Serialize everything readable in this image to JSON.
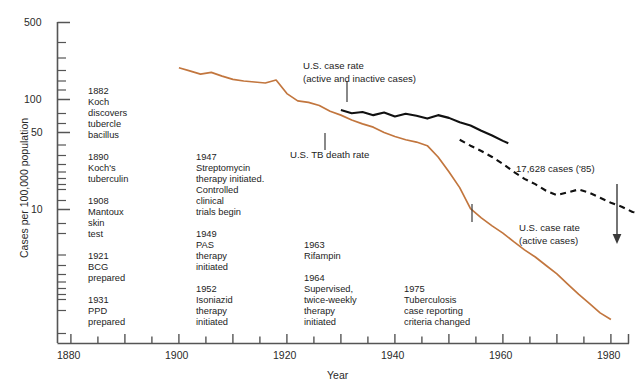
{
  "chart_data": {
    "type": "line",
    "title": "",
    "xlabel": "Year",
    "ylabel": "Cases per 100,000 population",
    "yscale": "log",
    "ylim": [
      1,
      600
    ],
    "xlim": [
      1875,
      1987
    ],
    "grid": false,
    "legend_position": "inline-annotations",
    "y_tick_labels": [
      "500",
      "100",
      "50",
      "10"
    ],
    "y_tick_values": [
      500,
      100,
      50,
      10
    ],
    "x_tick_labels": [
      "1880",
      "1900",
      "1920",
      "1940",
      "1960",
      "1980"
    ],
    "x_tick_values": [
      1880,
      1900,
      1920,
      1940,
      1960,
      1980
    ],
    "x_minor_step": 5,
    "series": [
      {
        "name": "U.S. TB death rate",
        "color": "#c2763e",
        "style": "solid",
        "x": [
          1900,
          1902,
          1904,
          1906,
          1908,
          1910,
          1912,
          1914,
          1916,
          1918,
          1920,
          1922,
          1924,
          1926,
          1928,
          1930,
          1932,
          1934,
          1936,
          1938,
          1940,
          1942,
          1944,
          1946,
          1948,
          1950,
          1952,
          1954,
          1956,
          1958,
          1960,
          1962,
          1964,
          1966,
          1968,
          1970,
          1972,
          1974,
          1976,
          1978,
          1980
        ],
        "y": [
          194,
          182,
          170,
          176,
          163,
          152,
          147,
          144,
          141,
          150,
          113,
          97,
          94,
          88,
          78,
          72,
          65,
          60,
          56,
          50,
          46,
          43,
          41,
          38,
          30,
          22,
          15.8,
          10.2,
          8.4,
          7.1,
          6.1,
          5.1,
          4.3,
          3.7,
          3.1,
          2.6,
          2.1,
          1.7,
          1.4,
          1.15,
          1.0
        ]
      },
      {
        "name": "U.S. case rate (active and inactive cases)",
        "color": "#111111",
        "style": "solid",
        "x": [
          1930,
          1932,
          1934,
          1936,
          1938,
          1940,
          1942,
          1944,
          1946,
          1948,
          1950,
          1952,
          1954,
          1956,
          1958,
          1960,
          1961
        ],
        "y": [
          80,
          75,
          77,
          72,
          76,
          70,
          74,
          71,
          67,
          72,
          68,
          62,
          58,
          52,
          47,
          42,
          40
        ]
      },
      {
        "name": "U.S. case rate (active cases)",
        "color": "#111111",
        "style": "dashed",
        "x": [
          1952,
          1954,
          1956,
          1958,
          1960,
          1962,
          1964,
          1966,
          1968,
          1970,
          1972,
          1974,
          1976,
          1978,
          1980,
          1982,
          1984,
          1985
        ],
        "y": [
          43,
          38,
          34,
          30,
          26,
          22,
          19,
          17,
          14.8,
          13.5,
          14.3,
          15.2,
          14.2,
          12.8,
          11.5,
          10.6,
          9.5,
          9.3
        ]
      }
    ],
    "annotations": [
      {
        "id": "a1882",
        "text": "1882\nKoch\ndiscovers\ntubercle\nbacillus"
      },
      {
        "id": "a1890",
        "text": "1890\nKoch's\ntuberculin"
      },
      {
        "id": "a1908",
        "text": "1908\nMantoux\nskin\ntest"
      },
      {
        "id": "a1921",
        "text": "1921\nBCG\nprepared"
      },
      {
        "id": "a1931",
        "text": "1931\nPPD\nprepared"
      },
      {
        "id": "a1947",
        "text": "1947\nStreptomycin\ntherapy initiated.\nControlled\nclinical\ntrials begin"
      },
      {
        "id": "a1949",
        "text": "1949\nPAS\ntherapy\ninitiated"
      },
      {
        "id": "a1952",
        "text": "1952\nIsoniazid\ntherapy\ninitiated"
      },
      {
        "id": "a1963",
        "text": "1963\nRifampin"
      },
      {
        "id": "a1964",
        "text": "1964\nSupervised,\ntwice-weekly\ntherapy\ninitiated"
      },
      {
        "id": "a1975",
        "text": "1975\nTuberculosis\ncase reporting\ncriteria changed"
      }
    ],
    "callouts": [
      {
        "id": "case-rate-all",
        "line1": "U.S. case rate",
        "line2": "(active and inactive cases)"
      },
      {
        "id": "death-rate",
        "line1": "U.S. TB death rate",
        "line2": ""
      },
      {
        "id": "case-rate-active",
        "line1": "U.S. case rate",
        "line2": "(active cases)"
      },
      {
        "id": "endpoint",
        "line1": "17,628 cases ('85)",
        "line2": ""
      }
    ]
  },
  "colors": {
    "death_rate_line": "#c2763e",
    "case_rate_line": "#111111",
    "axis": "#555555",
    "text": "#232323"
  }
}
